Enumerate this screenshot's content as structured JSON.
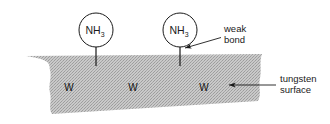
{
  "figure": {
    "background_color": "#ffffff",
    "surface_fill_color": "#b8b8b8",
    "stroke_color": "#1a1a1a"
  },
  "molecules": [
    {
      "formula_base": "NH",
      "formula_sub": "3",
      "cx": 96,
      "cy": 30,
      "r": 17
    },
    {
      "formula_base": "NH",
      "formula_sub": "3",
      "cx": 180,
      "cy": 30,
      "r": 17
    }
  ],
  "surface_atoms": [
    {
      "label": "W",
      "x": 69,
      "y": 91
    },
    {
      "label": "W",
      "x": 133,
      "y": 91
    },
    {
      "label": "W",
      "x": 204,
      "y": 91
    }
  ],
  "annotations": {
    "weak_bond": {
      "line1": "weak",
      "line2": "bond",
      "text_x": 224,
      "text_y1": 32,
      "text_y2": 43
    },
    "tungsten_surface": {
      "line1": "tungsten",
      "line2": "surface",
      "text_x": 280,
      "text_y1": 82,
      "text_y2": 93
    }
  }
}
